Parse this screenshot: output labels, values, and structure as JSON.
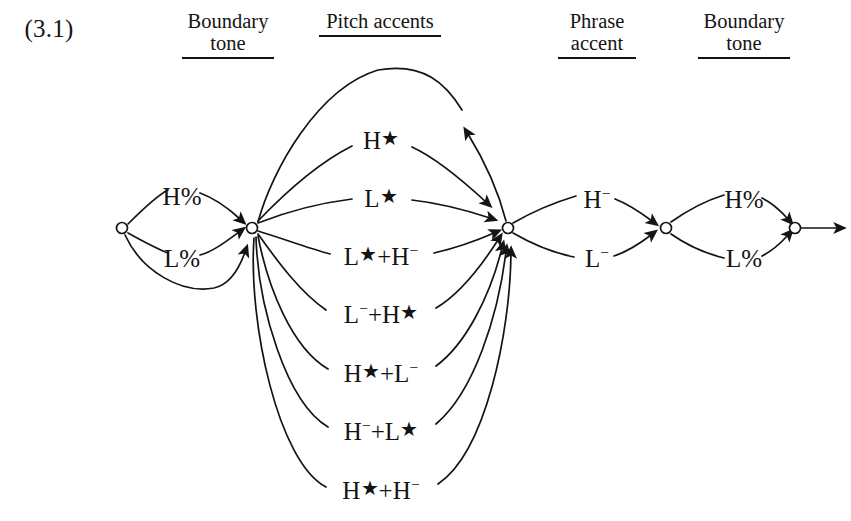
{
  "page": {
    "example_number": "(3.1)",
    "background": "#ffffff",
    "ink": "#141414",
    "width": 851,
    "height": 521
  },
  "columns": [
    {
      "name": "initial-boundary-tone",
      "line1": "Boundary",
      "line2": "tone",
      "cx": 228,
      "top": 10,
      "rule_width": 92
    },
    {
      "name": "pitch-accents",
      "line1": "Pitch accents",
      "line2": "",
      "cx": 380,
      "top": 10,
      "rule_width": 122
    },
    {
      "name": "phrase-accent",
      "line1": "Phrase",
      "line2": "accent",
      "cx": 597,
      "top": 10,
      "rule_width": 78
    },
    {
      "name": "final-boundary-tone",
      "line1": "Boundary",
      "line2": "tone",
      "cx": 744,
      "top": 10,
      "rule_width": 92
    }
  ],
  "nodes": [
    {
      "name": "start-node",
      "id": "n0",
      "x": 122,
      "y": 228,
      "r": 5.5
    },
    {
      "name": "pitch-accent-hub-left",
      "id": "n1",
      "x": 252,
      "y": 228,
      "r": 5.5
    },
    {
      "name": "pitch-accent-hub-right",
      "id": "n2",
      "x": 508,
      "y": 228,
      "r": 5.5
    },
    {
      "name": "phrase-accent-node",
      "id": "n3",
      "x": 666,
      "y": 228,
      "r": 5.5
    },
    {
      "name": "final-node",
      "id": "n4",
      "x": 795,
      "y": 228,
      "r": 5.5
    }
  ],
  "boundary_tone_initial": {
    "options": [
      {
        "name": "initial-h-percent",
        "text_html": "H<span class=\"pct\">%</span>",
        "x": 182,
        "y": 196
      },
      {
        "name": "initial-l-percent",
        "text_html": "L<span class=\"pct\">%</span>",
        "x": 182,
        "y": 258
      }
    ],
    "has_empty_bypass_arc": true
  },
  "pitch_accents": {
    "has_iteration_loop": true,
    "options": [
      {
        "name": "pitch-accent-h-star",
        "text_html": "H<span class=\"star\">★</span>",
        "x": 381,
        "y": 140
      },
      {
        "name": "pitch-accent-l-star",
        "text_html": "L<span class=\"star\">★</span>",
        "x": 381,
        "y": 198
      },
      {
        "name": "pitch-accent-l-star-h",
        "text_html": "L<span class=\"star\">★</span>+H<sup>−</sup>",
        "x": 381,
        "y": 256
      },
      {
        "name": "pitch-accent-l-h-star",
        "text_html": "L<sup>−</sup>+H<span class=\"star\">★</span>",
        "x": 381,
        "y": 314
      },
      {
        "name": "pitch-accent-h-star-l",
        "text_html": "H<span class=\"star\">★</span>+L<sup>−</sup>",
        "x": 381,
        "y": 373
      },
      {
        "name": "pitch-accent-h-l-star",
        "text_html": "H<sup>−</sup>+L<span class=\"star\">★</span>",
        "x": 381,
        "y": 431
      },
      {
        "name": "pitch-accent-h-star-h",
        "text_html": "H<span class=\"star\">★</span>+H<sup>−</sup>",
        "x": 381,
        "y": 490
      }
    ]
  },
  "phrase_accent": {
    "options": [
      {
        "name": "phrase-accent-h",
        "text_html": "H<sup>−</sup>",
        "x": 597,
        "y": 199
      },
      {
        "name": "phrase-accent-l",
        "text_html": "L<sup>−</sup>",
        "x": 597,
        "y": 258
      }
    ]
  },
  "boundary_tone_final": {
    "options": [
      {
        "name": "final-h-percent",
        "text_html": "H<span class=\"pct\">%</span>",
        "x": 744,
        "y": 199
      },
      {
        "name": "final-l-percent",
        "text_html": "L<span class=\"pct\">%</span>",
        "x": 744,
        "y": 258
      }
    ]
  },
  "exit": {
    "name": "exit-arrow",
    "from_x": 801,
    "to_x": 845,
    "y": 228
  }
}
